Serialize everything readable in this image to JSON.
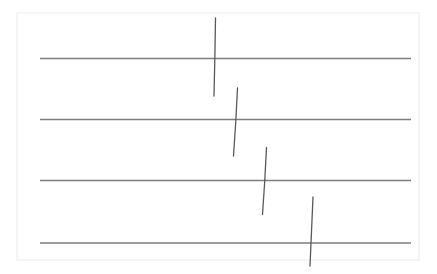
{
  "canvas": {
    "width": 437,
    "height": 274,
    "background_color": "#ffffff"
  },
  "frame": {
    "name": "page-frame",
    "x": 17,
    "y": 13,
    "width": 402,
    "height": 247,
    "stroke_color": "#f1f1f1",
    "stroke_width": 1.4,
    "fill_color": "#ffffff"
  },
  "chart_data": {
    "type": "line",
    "title": "",
    "subtitle": "",
    "xlabel": "",
    "ylabel": "",
    "grid": false,
    "legend": null,
    "xlim": [
      0,
      437
    ],
    "ylim": [
      0,
      274
    ],
    "series": [
      {
        "name": "horizontal-rules",
        "role": "ruled-lines",
        "count": 4,
        "stroke_color": "#7d7d7d",
        "stroke_width": 1.6,
        "x_start": 40,
        "x_end": 411,
        "values": [
          58.5,
          119.5,
          180.5,
          243.0
        ],
        "labels": [
          "rule-1",
          "rule-2",
          "rule-3",
          "rule-4"
        ]
      },
      {
        "name": "crossing-strokes",
        "role": "vertical-marks",
        "count": 4,
        "stroke_color": "#595959",
        "stroke_width": 1.3,
        "points": [
          {
            "label": "stroke-1",
            "crosses_rule": 1,
            "x_top": 215.5,
            "y_top": 18.0,
            "x_mid": 215.0,
            "y_mid": 57.0,
            "x_bot": 214.0,
            "y_bot": 96.0
          },
          {
            "label": "stroke-2",
            "crosses_rule": 2,
            "x_top": 237.5,
            "y_top": 88.0,
            "x_mid": 236.0,
            "y_mid": 122.0,
            "x_bot": 233.5,
            "y_bot": 156.0
          },
          {
            "label": "stroke-3",
            "crosses_rule": 3,
            "x_top": 266.5,
            "y_top": 147.5,
            "x_mid": 265.0,
            "y_mid": 181.0,
            "x_bot": 262.5,
            "y_bot": 214.5
          },
          {
            "label": "stroke-4",
            "crosses_rule": 4,
            "x_top": 313.0,
            "y_top": 197.0,
            "x_mid": 311.5,
            "y_mid": 232.0,
            "x_bot": 310.0,
            "y_bot": 266.0
          }
        ]
      }
    ]
  }
}
